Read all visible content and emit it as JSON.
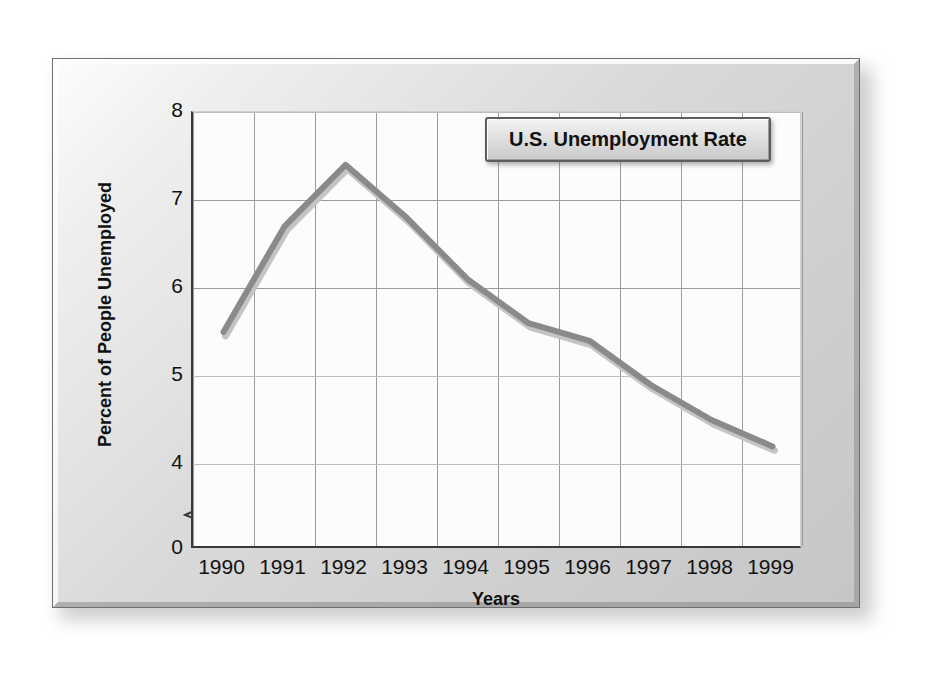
{
  "chart_data": {
    "type": "line",
    "title": "U.S. Unemployment Rate",
    "xlabel": "Years",
    "ylabel": "Percent of People Unemployed",
    "categories": [
      "1990",
      "1991",
      "1992",
      "1993",
      "1994",
      "1995",
      "1996",
      "1997",
      "1998",
      "1999"
    ],
    "values": [
      5.5,
      6.7,
      7.4,
      6.8,
      6.1,
      5.6,
      5.4,
      4.9,
      4.5,
      4.2
    ],
    "series": [
      {
        "name": "U.S. Unemployment Rate",
        "values": [
          5.5,
          6.7,
          7.4,
          6.8,
          6.1,
          5.6,
          5.4,
          4.9,
          4.5,
          4.2
        ]
      }
    ],
    "y_ticks": [
      "0",
      "4",
      "5",
      "6",
      "7",
      "8"
    ],
    "y_tick_values": [
      0,
      4,
      5,
      6,
      7,
      8
    ],
    "ylim": [
      4,
      8
    ],
    "y_axis_broken": true,
    "y_axis_break_note": "axis break between 0 and 4",
    "grid": true,
    "legend_position": "top-right",
    "line_color": "#8a8a8a",
    "line_shadow_color": "#c4c4c4",
    "plot_background": "#fcfcfc"
  },
  "panel": {
    "background_color": "#d4d4d4",
    "border_color": "#6f6f6f"
  }
}
